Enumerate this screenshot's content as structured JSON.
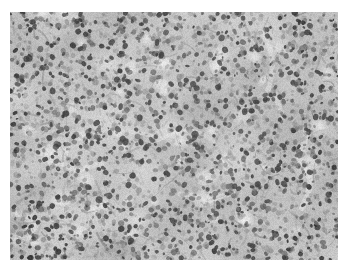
{
  "document": {
    "kind": "figure",
    "figure_type": "photomicrograph",
    "color_mode": "grayscale",
    "background_color": "#ffffff"
  },
  "figure": {
    "name": "histopathology-micrograph",
    "alt_text": "Grayscale photomicrograph of densely cellular tissue with numerous small dark nuclei, mid-gray cytoplasm and scattered pale interstitial spaces",
    "frame": {
      "x": 10,
      "y": 12,
      "width": 328,
      "height": 248
    },
    "margins": {
      "left": 10,
      "top": 12,
      "right": 10,
      "bottom": 13
    },
    "palette": {
      "paper": "#ffffff",
      "highlight": "#f6f6f6",
      "light_gray": "#dcdcdc",
      "mid_gray": "#a8a8a8",
      "dark_gray": "#6a6a6a",
      "nucleus_dark": "#2a2a2a",
      "nucleus_black": "#101010"
    },
    "texture": {
      "description": "dense small-cell infiltrate",
      "nucleus_count": 2600,
      "nucleus_min_radius": 1.1,
      "nucleus_max_radius": 3.2,
      "stroma_strand_count": 520,
      "pale_space_count": 46,
      "grain_intensity": 26,
      "mean_luminance": 168,
      "contrast": 0.74,
      "random_seed": 20240117
    },
    "pale_regions": [
      {
        "cx": 40,
        "cy": 142,
        "rx": 17,
        "ry": 12,
        "intensity": 0.92
      },
      {
        "cx": 96,
        "cy": 52,
        "rx": 14,
        "ry": 10,
        "intensity": 0.72
      },
      {
        "cx": 160,
        "cy": 120,
        "rx": 22,
        "ry": 14,
        "intensity": 0.66
      },
      {
        "cx": 196,
        "cy": 186,
        "rx": 20,
        "ry": 13,
        "intensity": 0.8
      },
      {
        "cx": 266,
        "cy": 36,
        "rx": 16,
        "ry": 11,
        "intensity": 0.74
      },
      {
        "cx": 300,
        "cy": 150,
        "rx": 18,
        "ry": 22,
        "intensity": 0.7
      },
      {
        "cx": 128,
        "cy": 208,
        "rx": 15,
        "ry": 10,
        "intensity": 0.62
      },
      {
        "cx": 62,
        "cy": 96,
        "rx": 12,
        "ry": 9,
        "intensity": 0.58
      },
      {
        "cx": 232,
        "cy": 104,
        "rx": 13,
        "ry": 10,
        "intensity": 0.56
      },
      {
        "cx": 20,
        "cy": 206,
        "rx": 12,
        "ry": 10,
        "intensity": 0.6
      }
    ],
    "dark_regions": [
      {
        "cx": 248,
        "cy": 64,
        "rx": 30,
        "ry": 20,
        "intensity": 0.4
      },
      {
        "cx": 70,
        "cy": 30,
        "rx": 26,
        "ry": 16,
        "intensity": 0.34
      },
      {
        "cx": 150,
        "cy": 34,
        "rx": 24,
        "ry": 15,
        "intensity": 0.3
      },
      {
        "cx": 300,
        "cy": 214,
        "rx": 26,
        "ry": 20,
        "intensity": 0.34
      },
      {
        "cx": 106,
        "cy": 236,
        "rx": 30,
        "ry": 14,
        "intensity": 0.28
      },
      {
        "cx": 186,
        "cy": 150,
        "rx": 22,
        "ry": 14,
        "intensity": 0.24
      },
      {
        "cx": 26,
        "cy": 180,
        "rx": 20,
        "ry": 14,
        "intensity": 0.26
      },
      {
        "cx": 318,
        "cy": 96,
        "rx": 18,
        "ry": 22,
        "intensity": 0.28
      }
    ],
    "vessel_strands": [
      {
        "points": [
          [
            250,
            20
          ],
          [
            262,
            48
          ],
          [
            258,
            78
          ],
          [
            272,
            104
          ]
        ],
        "width": 5,
        "intensity": 0.55
      },
      {
        "points": [
          [
            296,
            120
          ],
          [
            288,
            146
          ],
          [
            300,
            170
          ],
          [
            292,
            196
          ]
        ],
        "width": 6,
        "intensity": 0.62
      },
      {
        "points": [
          [
            120,
            120
          ],
          [
            148,
            128
          ],
          [
            176,
            118
          ],
          [
            204,
            130
          ]
        ],
        "width": 4,
        "intensity": 0.48
      },
      {
        "points": [
          [
            40,
            150
          ],
          [
            66,
            160
          ],
          [
            92,
            152
          ]
        ],
        "width": 5,
        "intensity": 0.58
      },
      {
        "points": [
          [
            170,
            182
          ],
          [
            196,
            190
          ],
          [
            224,
            182
          ]
        ],
        "width": 5,
        "intensity": 0.52
      }
    ]
  }
}
